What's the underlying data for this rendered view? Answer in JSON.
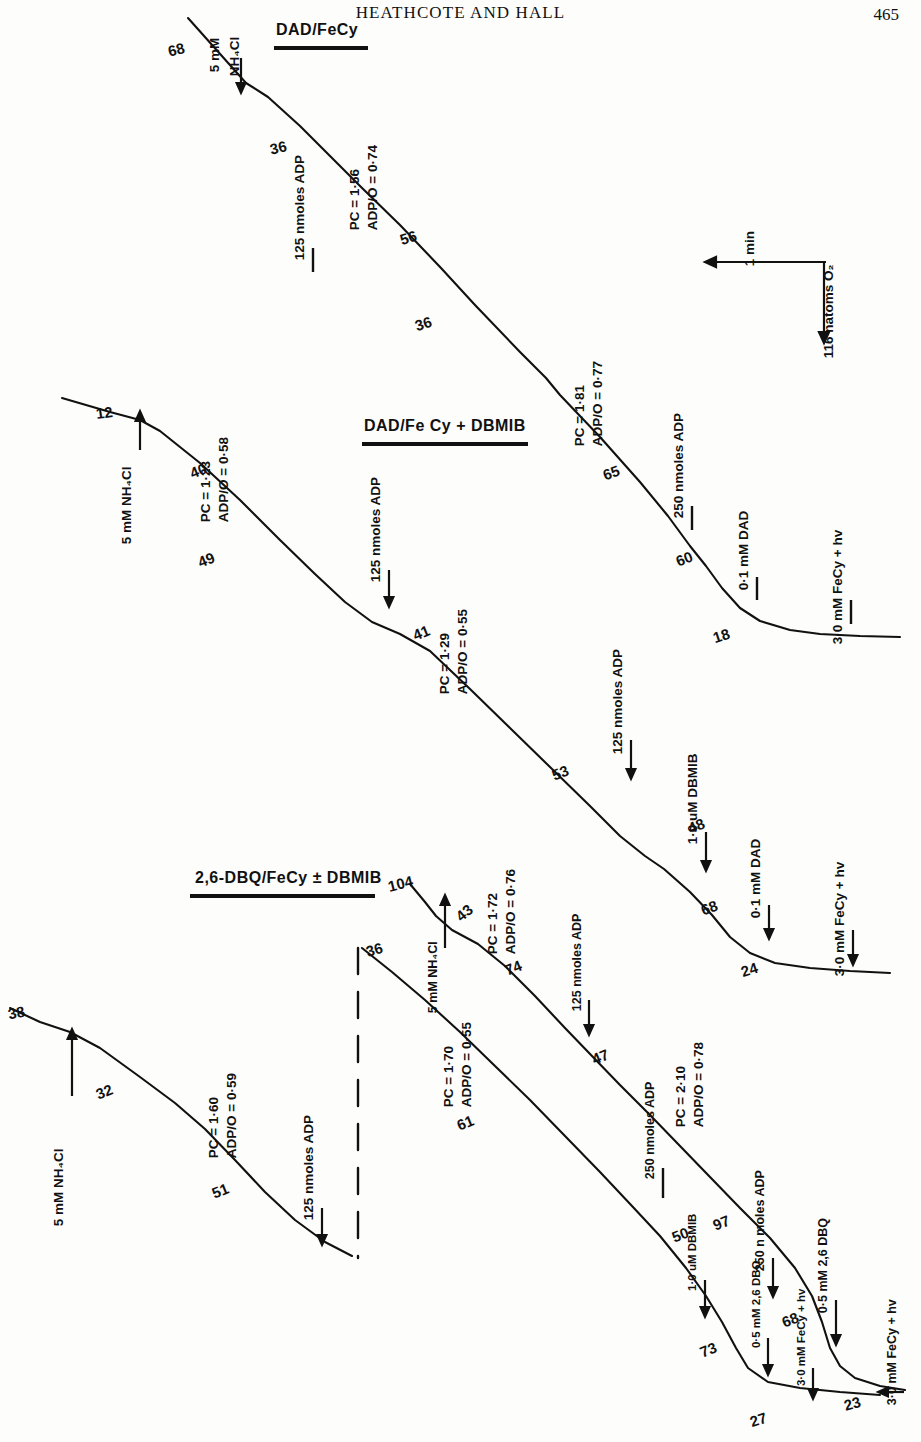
{
  "header": {
    "running_head": "HEATHCOTE AND HALL",
    "page_number": "465"
  },
  "sections": [
    {
      "id": "dad-fecy",
      "title": "DAD/FeCy"
    },
    {
      "id": "dad-fecy-dbmib",
      "title": "DAD/Fe Cy + DBMIB"
    },
    {
      "id": "dbq-fecy-dbmib",
      "title": "2,6-DBQ/FeCy ± DBMIB"
    }
  ],
  "scale_bar": {
    "time_label": "1 min",
    "oxygen_label": "116 natoms O₂"
  },
  "trace1": {
    "name": "DAD/FeCy",
    "rates": [
      "68",
      "36",
      "56",
      "36",
      "65",
      "60",
      "18"
    ],
    "additions": [
      {
        "label_line1": "5 mM",
        "label_line2": "NH₄Cl"
      },
      {
        "label": "125 nmoles ADP"
      },
      {
        "label": "250 nmoles ADP"
      },
      {
        "label": "0·1 mM DAD"
      },
      {
        "label": "3·0 mM FeCy + hv"
      }
    ],
    "ratios": [
      {
        "pc": "PC = 1·56",
        "adpo": "ADP/O = 0·74"
      },
      {
        "pc": "PC = 1·81",
        "adpo": "ADP/O = 0·77"
      }
    ]
  },
  "trace2": {
    "name": "DAD/FeCy + DBMIB",
    "rates": [
      "12",
      "40",
      "49",
      "41",
      "53",
      "48",
      "68",
      "24"
    ],
    "additions": [
      {
        "label": "5 mM NH₄Cl"
      },
      {
        "label": "125 nmoles ADP"
      },
      {
        "label": "125 nmoles ADP"
      },
      {
        "label": "1·0 uM DBMIB"
      },
      {
        "label": "0·1 mM DAD"
      },
      {
        "label": "3·0 mM FeCy + hv"
      }
    ],
    "ratios": [
      {
        "pc": "PC = 1·23",
        "adpo": "ADP/O = 0·58"
      },
      {
        "pc": "PC = 1·29",
        "adpo": "ADP/O = 0·55"
      }
    ]
  },
  "trace3": {
    "name": "2,6-DBQ/FeCy minus DBMIB",
    "rates": [
      "38",
      "32",
      "51"
    ],
    "additions": [
      {
        "label": "5 mM NH₄Cl"
      },
      {
        "label": "125 nmoles ADP"
      }
    ],
    "ratios": [
      {
        "pc": "PC = 1·60",
        "adpo": "ADP/O = 0·59"
      }
    ]
  },
  "trace4": {
    "name": "2,6-DBQ/FeCy upper",
    "rates": [
      "104",
      "43",
      "74",
      "47",
      "97",
      "68",
      "23"
    ],
    "additions": [
      {
        "label": "5 mM NH₄Cl"
      },
      {
        "label": "125 nmoles ADP"
      },
      {
        "label": "250 n moles ADP"
      },
      {
        "label": "0·5 mM 2,6 DBQ"
      },
      {
        "label": "3·0 mM FeCy + hv"
      }
    ],
    "ratios": [
      {
        "pc": "PC = 1·72",
        "adpo": "ADP/O = 0·76"
      },
      {
        "pc": "PC = 2·10",
        "adpo": "ADP/O = 0·78"
      }
    ]
  },
  "trace5": {
    "name": "2,6-DBQ/FeCy lower",
    "rates": [
      "36",
      "61",
      "50",
      "73",
      "27"
    ],
    "additions": [
      {
        "label": "250 nmoles ADP"
      },
      {
        "label": "1·0 uM DBMIB"
      },
      {
        "label": "0·5 mM 2,6 DBQ"
      },
      {
        "label": "3·0 mM FeCy + hv"
      }
    ],
    "ratios": [
      {
        "pc": "PC = 1·70",
        "adpo": "ADP/O = 0·55"
      }
    ]
  },
  "colors": {
    "ink": "#111111",
    "paper": "#fdfdfb"
  }
}
